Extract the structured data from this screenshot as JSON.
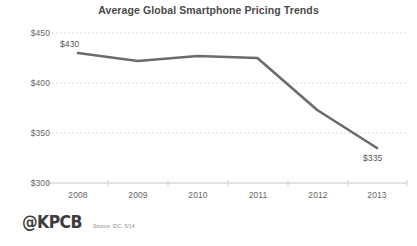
{
  "chart_data": {
    "type": "line",
    "title": "Average Global Smartphone Pricing Trends",
    "xlabel": "",
    "ylabel": "",
    "categories": [
      "2008",
      "2009",
      "2010",
      "2011",
      "2012",
      "2013"
    ],
    "x": [
      2008,
      2009,
      2010,
      2011,
      2012,
      2013
    ],
    "values": [
      430,
      422,
      427,
      425,
      373,
      335
    ],
    "series": [
      {
        "name": "Average Global Smartphone Price",
        "values": [
          430,
          422,
          427,
          425,
          373,
          335
        ]
      }
    ],
    "ylim": [
      300,
      450
    ],
    "ytick_labels": [
      "$450",
      "$400",
      "$350",
      "$300"
    ],
    "ytick_values": [
      450,
      400,
      350,
      300
    ],
    "xtick_labels": [
      "2008",
      "2009",
      "2010",
      "2011",
      "2012",
      "2013"
    ],
    "grid": true,
    "legend": false,
    "line_color": "#6b6b6b",
    "grid_color": "#d8d8d8",
    "annotations": [
      {
        "label": "$430",
        "x": 2008,
        "y": 430,
        "position": "above"
      },
      {
        "label": "$335",
        "x": 2013,
        "y": 335,
        "position": "below"
      }
    ]
  },
  "footer": {
    "brand": "@KPCB",
    "source": "Source: IDC, 5/14"
  }
}
